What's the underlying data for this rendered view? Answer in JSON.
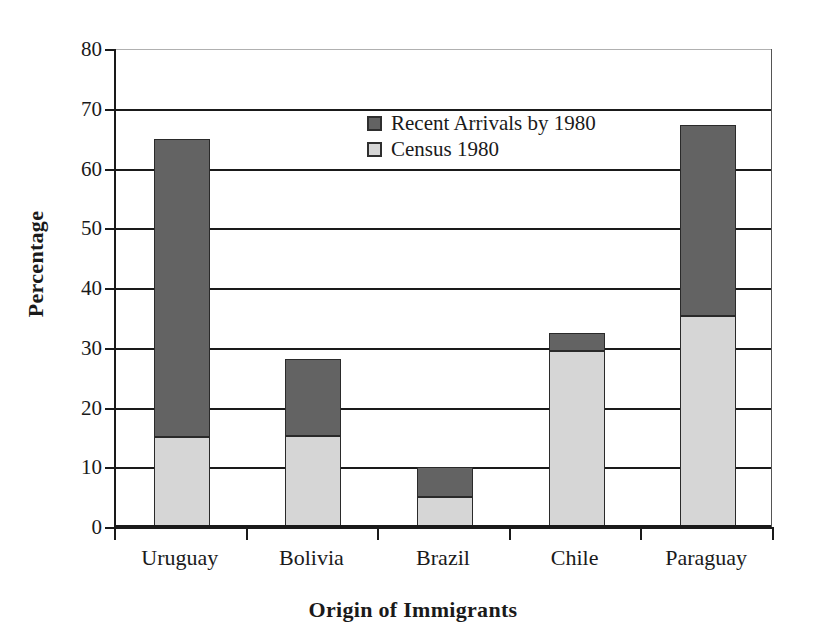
{
  "chart_data": {
    "type": "bar",
    "subtype": "stacked",
    "title": "",
    "xlabel": "Origin of Immigrants",
    "ylabel": "Percentage",
    "categories": [
      "Uruguay",
      "Bolivia",
      "Brazil",
      "Chile",
      "Paraguay"
    ],
    "series": [
      {
        "name": "Census 1980",
        "color": "#d6d6d6",
        "values": [
          15.0,
          15.2,
          5.0,
          29.5,
          35.3
        ]
      },
      {
        "name": "Recent Arrivals by 1980",
        "color": "#636363",
        "values": [
          50.0,
          13.0,
          5.0,
          3.0,
          32.0
        ]
      }
    ],
    "stack_order": [
      "Census 1980",
      "Recent Arrivals by 1980"
    ],
    "totals": [
      65.0,
      28.2,
      10.0,
      32.5,
      67.3
    ],
    "ylim": [
      0,
      80
    ],
    "yticks": [
      0,
      10,
      20,
      30,
      40,
      50,
      60,
      70,
      80
    ],
    "ytick_labels": [
      "0",
      "10",
      "20",
      "30",
      "40",
      "50",
      "60",
      "70",
      "80"
    ],
    "grid": "horizontal",
    "legend_position": "top-center",
    "legend_entries": [
      {
        "label": "Recent Arrivals by 1980",
        "color": "#636363"
      },
      {
        "label": "Census 1980",
        "color": "#d6d6d6"
      }
    ]
  },
  "colors": {
    "recent_arrivals": "#636363",
    "census": "#d6d6d6",
    "axis": "#1a1a1a",
    "background": "#ffffff"
  }
}
